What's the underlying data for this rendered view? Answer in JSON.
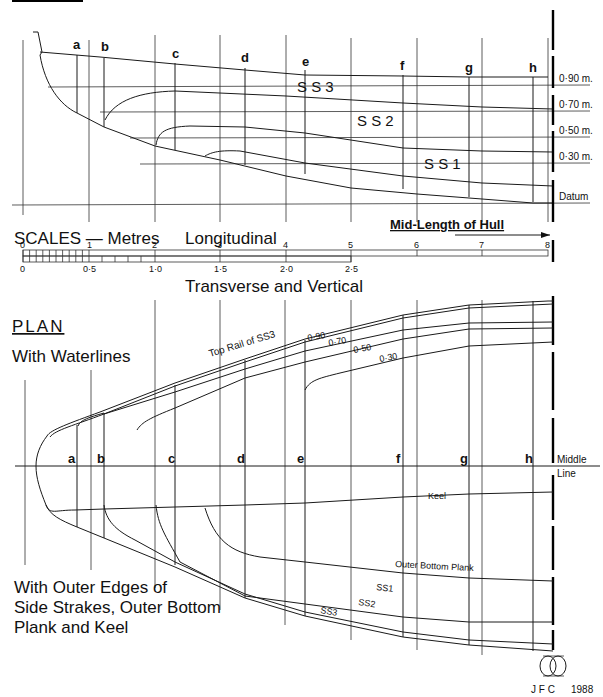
{
  "drawing": {
    "header_underline_partial": "",
    "elevation": {
      "station_labels": [
        "a",
        "b",
        "c",
        "d",
        "e",
        "f",
        "g",
        "h"
      ],
      "waterline_labels": [
        "0·90 m.",
        "0·70 m.",
        "0·50 m.",
        "0·30 m.",
        "Datum"
      ],
      "strake_labels": [
        "S S 3",
        "S S 2",
        "S S 1"
      ]
    },
    "scales": {
      "title": "SCALES — Metres",
      "longitudinal_label": "Longitudinal",
      "longitudinal_ticks": [
        "0",
        "1",
        "2",
        "3",
        "4",
        "5",
        "6",
        "7",
        "8"
      ],
      "transverse_ticks": [
        "0",
        "0·5",
        "1·0",
        "1·5",
        "2·0",
        "2·5"
      ],
      "transverse_label": "Transverse and Vertical",
      "midlength_label": "Mid-Length of Hull"
    },
    "plan": {
      "title": "PLAN",
      "subtitle": "With Waterlines",
      "top_rail_label": "Top Rail of SS3",
      "waterline_labels": [
        "0·90",
        "0·70",
        "0·50",
        "0·30"
      ],
      "station_labels": [
        "a",
        "b",
        "c",
        "d",
        "e",
        "f",
        "g",
        "h"
      ],
      "middle_line_label_1": "Middle",
      "middle_line_label_2": "Line",
      "keel_label": "Keel",
      "outer_bottom_plank_label": "Outer Bottom Plank",
      "strake_labels": [
        "SS1",
        "SS2",
        "SS3"
      ],
      "caption_line_1": "With Outer Edges of",
      "caption_line_2": "Side Strakes, Outer Bottom",
      "caption_line_3": "Plank and Keel"
    },
    "signature": {
      "initials": "J F C",
      "year": "1988"
    }
  }
}
